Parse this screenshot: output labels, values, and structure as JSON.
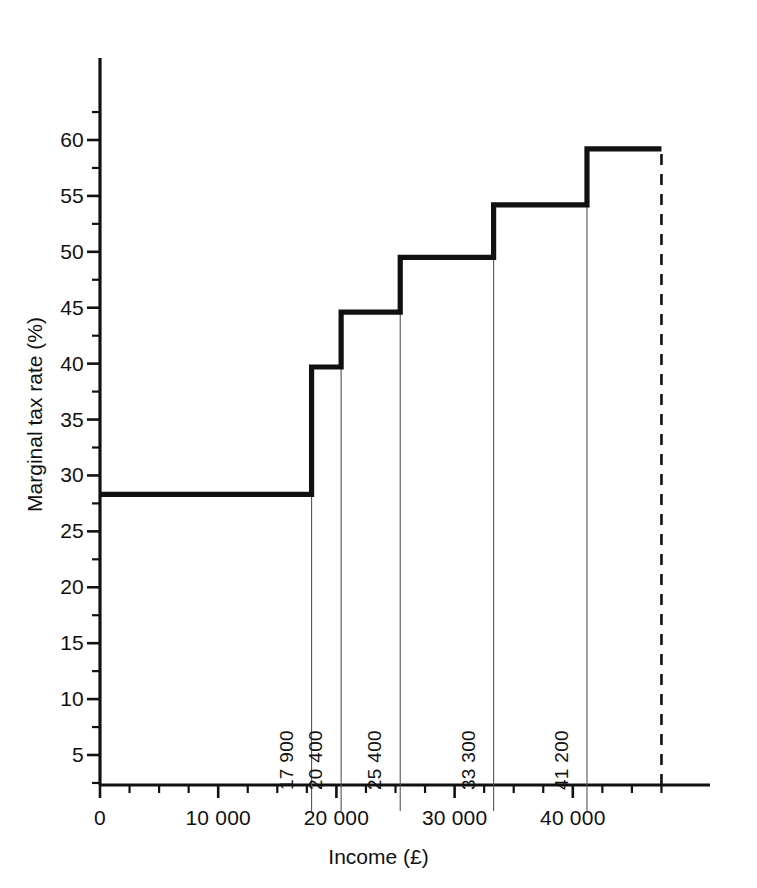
{
  "chart_data": {
    "type": "line",
    "subtype": "step",
    "title": "",
    "xlabel": "Income (£)",
    "ylabel": "Marginal tax rate (%)",
    "xlim": [
      0,
      48500
    ],
    "ylim": [
      0,
      63
    ],
    "grid": false,
    "legend": null,
    "x_ticks": [
      0,
      10000,
      20000,
      30000,
      40000
    ],
    "x_tick_labels": [
      "0",
      "10 000",
      "20 000",
      "30 000",
      "40 000"
    ],
    "x_minor_tick_step": 2500,
    "y_ticks": [
      5,
      10,
      15,
      20,
      25,
      30,
      35,
      40,
      45,
      50,
      55,
      60
    ],
    "y_tick_labels": [
      "5",
      "10",
      "15",
      "20",
      "25",
      "30",
      "35",
      "40",
      "45",
      "50",
      "55",
      "60"
    ],
    "y_minor_tick_step": 2.5,
    "steps": [
      {
        "x_start": 0,
        "x_end": 17900,
        "rate": 28.3
      },
      {
        "x_start": 17900,
        "x_end": 20400,
        "rate": 39.7
      },
      {
        "x_start": 20400,
        "x_end": 25400,
        "rate": 44.6
      },
      {
        "x_start": 25400,
        "x_end": 33300,
        "rate": 49.5
      },
      {
        "x_start": 33300,
        "x_end": 41200,
        "rate": 54.2
      },
      {
        "x_start": 41200,
        "x_end": 47500,
        "rate": 59.2
      }
    ],
    "thresholds": [
      {
        "value": 17900,
        "label": "17 900"
      },
      {
        "value": 20400,
        "label": "20 400"
      },
      {
        "value": 25400,
        "label": "25 400"
      },
      {
        "value": 33300,
        "label": "33 300"
      },
      {
        "value": 41200,
        "label": "41 200"
      }
    ],
    "open_end": {
      "x": 47500,
      "style": "dashed",
      "note": "open-ended top band"
    },
    "colors": {
      "line": "#111111",
      "axis": "#111111",
      "dropline": "#555555",
      "background": "#ffffff"
    }
  }
}
